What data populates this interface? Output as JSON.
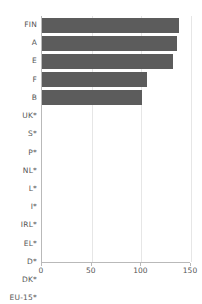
{
  "chart_data": {
    "type": "bar",
    "orientation": "horizontal",
    "title": "",
    "subtitle": "",
    "xlabel": "",
    "ylabel": "",
    "xlim": [
      0,
      150
    ],
    "xticks": [
      0,
      50,
      100,
      150
    ],
    "xtick_labels": [
      "0",
      "50",
      "100",
      "150"
    ],
    "grid": true,
    "grid_axis": "x",
    "legend": null,
    "bar_color": "#5c5c5c",
    "axis_color": "#b9b9b9",
    "gridline_color": "#e6e6e6",
    "categories": [
      "FIN",
      "A",
      "E",
      "F",
      "B",
      "UK*",
      "S*",
      "P*",
      "NL*",
      "L*",
      "I*",
      "IRL*",
      "EL*",
      "D*",
      "DK*",
      "EU-15*"
    ],
    "values": [
      138,
      136,
      132,
      106,
      101,
      0,
      0,
      0,
      0,
      0,
      0,
      0,
      0,
      0,
      0,
      0
    ],
    "annotations": [
      "* denotes no data reported"
    ]
  }
}
